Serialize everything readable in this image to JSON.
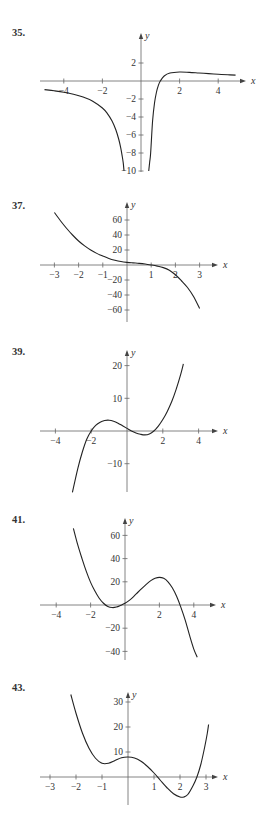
{
  "page": {
    "background": "#ffffff",
    "curve_color": "#222222",
    "axis_color": "#666666"
  },
  "chart_data": [
    {
      "id": "p35",
      "label": "35.",
      "type": "line",
      "xlabel": "x",
      "ylabel": "y",
      "frame": {
        "ox": 141,
        "oy": 81,
        "sx": 19.3,
        "sy": 9.0,
        "xmin_px": 40,
        "xmax_px": 246,
        "ymin_px": 33,
        "ymax_px": 172,
        "label_y": 32
      },
      "xticks": [
        -4,
        -2,
        2,
        4
      ],
      "yticks": [
        2,
        -2,
        -4,
        -6,
        -8,
        -10
      ],
      "ylim": [
        -10,
        3
      ],
      "xlim": [
        -5,
        5
      ],
      "series": [
        {
          "name": "left-branch",
          "points": [
            [
              -5,
              -0.96
            ],
            [
              -4.5,
              -1.09
            ],
            [
              -4,
              -1.25
            ],
            [
              -3.5,
              -1.47
            ],
            [
              -3,
              -1.78
            ],
            [
              -2.5,
              -2.24
            ],
            [
              -2,
              -3
            ],
            [
              -1.75,
              -3.59
            ],
            [
              -1.5,
              -4.44
            ],
            [
              -1.3,
              -5.44
            ],
            [
              -1.15,
              -6.5
            ],
            [
              -1.05,
              -7.44
            ],
            [
              -0.97,
              -8.4
            ],
            [
              -0.92,
              -9.1
            ],
            [
              -0.88,
              -10
            ]
          ]
        },
        {
          "name": "right-branch",
          "points": [
            [
              0.4,
              -10
            ],
            [
              0.45,
              -9.0
            ],
            [
              0.5,
              -8
            ],
            [
              0.6,
              -4.44
            ],
            [
              0.7,
              -2.45
            ],
            [
              0.8,
              -1.25
            ],
            [
              0.9,
              -0.49
            ],
            [
              1,
              0
            ],
            [
              1.2,
              0.56
            ],
            [
              1.5,
              0.89
            ],
            [
              2,
              1
            ],
            [
              2.5,
              0.96
            ],
            [
              3,
              0.89
            ],
            [
              3.5,
              0.82
            ],
            [
              4,
              0.75
            ],
            [
              4.5,
              0.69
            ],
            [
              4.9,
              0.65
            ]
          ]
        }
      ]
    },
    {
      "id": "p37",
      "label": "37.",
      "type": "line",
      "xlabel": "x",
      "ylabel": "y",
      "frame": {
        "ox": 127,
        "oy": 265,
        "sx": 24.2,
        "sy": 0.75,
        "xmin_px": 40,
        "xmax_px": 218,
        "ymin_px": 202,
        "ymax_px": 322,
        "label_y": 202
      },
      "xticks": [
        -3,
        -2,
        -1,
        1,
        2,
        3
      ],
      "yticks": [
        60,
        40,
        20,
        -20,
        -40,
        -60
      ],
      "ylim": [
        -70,
        75
      ],
      "xlim": [
        -3.5,
        3.7
      ],
      "series": [
        {
          "name": "f",
          "points": [
            [
              -3,
              70
            ],
            [
              -2.75,
              59
            ],
            [
              -2.5,
              49
            ],
            [
              -2.25,
              40
            ],
            [
              -2,
              32
            ],
            [
              -1.75,
              25.5
            ],
            [
              -1.5,
              20
            ],
            [
              -1.25,
              15.5
            ],
            [
              -1,
              12
            ],
            [
              -0.75,
              8.8
            ],
            [
              -0.5,
              6.4
            ],
            [
              -0.25,
              4.6
            ],
            [
              0,
              3.5
            ],
            [
              0.25,
              2.8
            ],
            [
              0.5,
              2.2
            ],
            [
              0.75,
              1.3
            ],
            [
              1,
              0
            ],
            [
              1.25,
              -1.5
            ],
            [
              1.5,
              -3.5
            ],
            [
              1.75,
              -7
            ],
            [
              2,
              -13
            ],
            [
              2.25,
              -21
            ],
            [
              2.5,
              -30
            ],
            [
              2.75,
              -42
            ],
            [
              3,
              -58
            ]
          ]
        }
      ]
    },
    {
      "id": "p39",
      "label": "39.",
      "type": "line",
      "xlabel": "x",
      "ylabel": "y",
      "frame": {
        "ox": 127,
        "oy": 431,
        "sx": 17.9,
        "sy": 3.27,
        "xmin_px": 40,
        "xmax_px": 218,
        "ymin_px": 350,
        "ymax_px": 492,
        "label_y": 350
      },
      "xticks": [
        -4,
        -2,
        2,
        4
      ],
      "yticks": [
        20,
        10,
        -10
      ],
      "ylim": [
        -18.8,
        25
      ],
      "xlim": [
        -4.8,
        5
      ],
      "series": [
        {
          "name": "f",
          "points": [
            [
              -3.05,
              -18.8
            ],
            [
              -2.75,
              -11.5
            ],
            [
              -2.5,
              -6.5
            ],
            [
              -2.25,
              -2.5
            ],
            [
              -2,
              0
            ],
            [
              -1.75,
              1.7
            ],
            [
              -1.5,
              2.7
            ],
            [
              -1.25,
              3.2
            ],
            [
              -1,
              3.3
            ],
            [
              -0.75,
              3.0
            ],
            [
              -0.5,
              2.4
            ],
            [
              -0.25,
              1.6
            ],
            [
              0,
              0.8
            ],
            [
              0.25,
              0.0
            ],
            [
              0.5,
              -0.6
            ],
            [
              0.75,
              -1.0
            ],
            [
              1,
              -1.2
            ],
            [
              1.25,
              -0.9
            ],
            [
              1.5,
              0
            ],
            [
              1.75,
              1.5
            ],
            [
              2,
              3.5
            ],
            [
              2.25,
              6.0
            ],
            [
              2.5,
              9.0
            ],
            [
              2.75,
              12.8
            ],
            [
              3,
              17.3
            ],
            [
              3.15,
              20.5
            ]
          ]
        }
      ]
    },
    {
      "id": "p41",
      "label": "41.",
      "type": "line",
      "xlabel": "x",
      "ylabel": "y",
      "frame": {
        "ox": 125,
        "oy": 605,
        "sx": 17.2,
        "sy": 1.16,
        "xmin_px": 40,
        "xmax_px": 216,
        "ymin_px": 518,
        "ymax_px": 660,
        "label_y": 518
      },
      "xticks": [
        -4,
        -2,
        2,
        4
      ],
      "yticks": [
        60,
        40,
        20,
        -20,
        -40
      ],
      "ylim": [
        -47,
        70
      ],
      "xlim": [
        -4.8,
        5
      ],
      "series": [
        {
          "name": "f",
          "points": [
            [
              -3,
              66
            ],
            [
              -2.75,
              52
            ],
            [
              -2.5,
              40
            ],
            [
              -2.25,
              29
            ],
            [
              -2,
              19.5
            ],
            [
              -1.75,
              12
            ],
            [
              -1.5,
              5.8
            ],
            [
              -1.25,
              1.5
            ],
            [
              -1,
              -1.2
            ],
            [
              -0.75,
              -2.2
            ],
            [
              -0.5,
              -1.8
            ],
            [
              -0.25,
              -0.3
            ],
            [
              0,
              1.5
            ],
            [
              0.25,
              4
            ],
            [
              0.5,
              7.3
            ],
            [
              0.75,
              11
            ],
            [
              1,
              14.6
            ],
            [
              1.25,
              18
            ],
            [
              1.5,
              21
            ],
            [
              1.75,
              23
            ],
            [
              2,
              23.8
            ],
            [
              2.25,
              23
            ],
            [
              2.5,
              20
            ],
            [
              2.75,
              14.8
            ],
            [
              3,
              7.5
            ],
            [
              3.25,
              -2
            ],
            [
              3.5,
              -13
            ],
            [
              3.75,
              -26
            ],
            [
              4,
              -38
            ],
            [
              4.2,
              -45
            ]
          ]
        }
      ]
    },
    {
      "id": "p43",
      "label": "43.",
      "type": "line",
      "xlabel": "x",
      "ylabel": "y",
      "frame": {
        "ox": 128,
        "oy": 777,
        "sx": 26,
        "sy": 2.5,
        "xmin_px": 40,
        "xmax_px": 218,
        "ymin_px": 692,
        "ymax_px": 805,
        "label_y": 692
      },
      "xticks": [
        -3,
        -2,
        -1,
        1,
        2,
        3
      ],
      "yticks": [
        30,
        20,
        10
      ],
      "ylim": [
        -11,
        34
      ],
      "xlim": [
        -3.3,
        3.5
      ],
      "series": [
        {
          "name": "f",
          "points": [
            [
              -2.2,
              33
            ],
            [
              -2,
              25.5
            ],
            [
              -1.75,
              17.5
            ],
            [
              -1.5,
              11.5
            ],
            [
              -1.25,
              7.5
            ],
            [
              -1,
              5.5
            ],
            [
              -0.75,
              5.5
            ],
            [
              -0.5,
              6.6
            ],
            [
              -0.25,
              7.7
            ],
            [
              0,
              8
            ],
            [
              0.25,
              7.6
            ],
            [
              0.5,
              6.3
            ],
            [
              0.75,
              4.2
            ],
            [
              1,
              1.6
            ],
            [
              1.25,
              -1.4
            ],
            [
              1.5,
              -4.3
            ],
            [
              1.75,
              -6.7
            ],
            [
              2,
              -8
            ],
            [
              2.15,
              -8
            ],
            [
              2.3,
              -7
            ],
            [
              2.5,
              -3.5
            ],
            [
              2.65,
              0
            ],
            [
              2.8,
              5
            ],
            [
              2.95,
              12
            ],
            [
              3.05,
              17.5
            ],
            [
              3.1,
              21
            ]
          ]
        }
      ]
    }
  ]
}
